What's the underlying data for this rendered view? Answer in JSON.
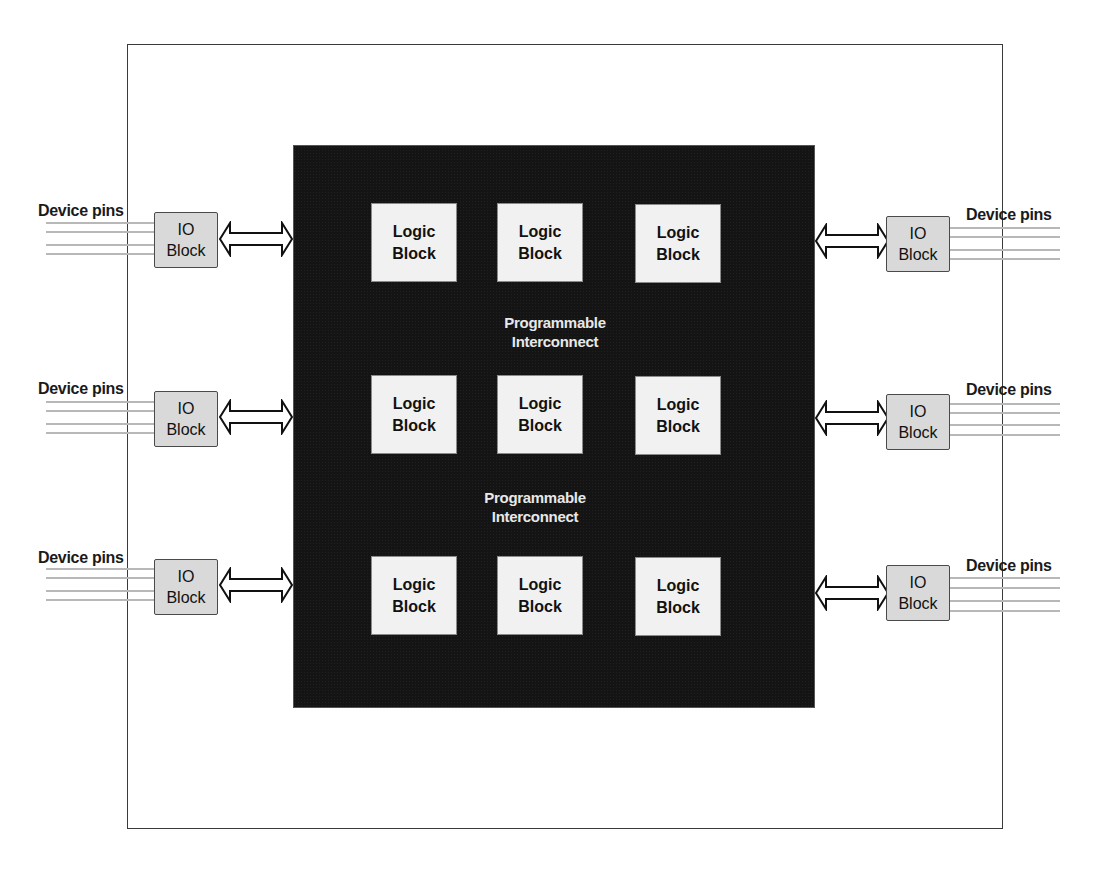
{
  "diagram": {
    "colors": {
      "fabric": "#141414",
      "logic_block_fill": "#f1f1f1",
      "io_block_fill": "#d9d9d9",
      "interconnect_text": "#e8e8e8",
      "pin_lines": "#b8b8b8",
      "frame": "#3a3a3a"
    },
    "logic_blocks": [
      {
        "line1": "Logic",
        "line2": "Block"
      },
      {
        "line1": "Logic",
        "line2": "Block"
      },
      {
        "line1": "Logic",
        "line2": "Block"
      },
      {
        "line1": "Logic",
        "line2": "Block"
      },
      {
        "line1": "Logic",
        "line2": "Block"
      },
      {
        "line1": "Logic",
        "line2": "Block"
      },
      {
        "line1": "Logic",
        "line2": "Block"
      },
      {
        "line1": "Logic",
        "line2": "Block"
      },
      {
        "line1": "Logic",
        "line2": "Block"
      }
    ],
    "interconnect_labels": [
      {
        "line1": "Programmable",
        "line2": "Interconnect"
      },
      {
        "line1": "Programmable",
        "line2": "Interconnect"
      }
    ],
    "io_blocks": {
      "left": [
        {
          "line1": "IO",
          "line2": "Block"
        },
        {
          "line1": "IO",
          "line2": "Block"
        },
        {
          "line1": "IO",
          "line2": "Block"
        }
      ],
      "right": [
        {
          "line1": "IO",
          "line2": "Block"
        },
        {
          "line1": "IO",
          "line2": "Block"
        },
        {
          "line1": "IO",
          "line2": "Block"
        }
      ]
    },
    "pin_labels": {
      "left": [
        "Device pins",
        "Device pins",
        "Device pins"
      ],
      "right": [
        "Device pins",
        "Device pins",
        "Device pins"
      ]
    },
    "icons": {
      "bus_arrow": "double-headed-bus-arrow-icon"
    }
  }
}
